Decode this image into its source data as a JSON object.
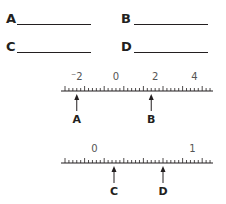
{
  "answers": [
    {
      "letter": "A",
      "value": ""
    },
    {
      "letter": "B",
      "value": ""
    },
    {
      "letter": "C",
      "value": ""
    },
    {
      "letter": "D",
      "value": ""
    }
  ],
  "number_line_1": {
    "labels": [
      "⁻2",
      "0",
      "2",
      "4"
    ],
    "label_values": [
      -2,
      0,
      2,
      4
    ],
    "major_tick_interval": 1,
    "minor_tick_interval": 0.2,
    "arrows": [
      {
        "letter": "A",
        "value": -2
      },
      {
        "letter": "B",
        "value": 1.8
      }
    ]
  },
  "number_line_2": {
    "labels": [
      "0",
      "1"
    ],
    "label_values": [
      0,
      1
    ],
    "major_tick_interval": 0.2,
    "minor_tick_interval": 0.04,
    "arrows": [
      {
        "letter": "C",
        "value": 0.2
      },
      {
        "letter": "D",
        "value": 0.7
      }
    ]
  }
}
